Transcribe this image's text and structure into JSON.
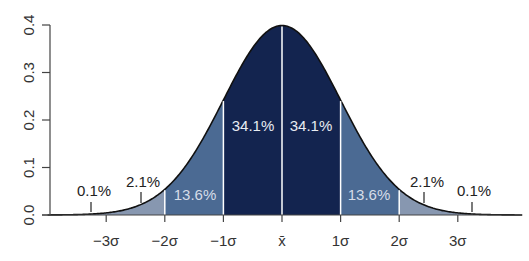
{
  "chart_data": {
    "type": "area",
    "title": "",
    "xlabel": "",
    "ylabel": "",
    "ylim": [
      0,
      0.4
    ],
    "xlim": [
      -4,
      4
    ],
    "grid": false,
    "yticks": [
      "0.0",
      "0.1",
      "0.2",
      "0.3",
      "0.4"
    ],
    "ytick_values": [
      0,
      0.1,
      0.2,
      0.3,
      0.4
    ],
    "xticks": [
      "−3σ",
      "−2σ",
      "−1σ",
      "x̄",
      "1σ",
      "2σ",
      "3σ"
    ],
    "xtick_values": [
      -3,
      -2,
      -1,
      0,
      1,
      2,
      3
    ],
    "distribution": "standard normal density",
    "regions": [
      {
        "from": -4,
        "to": -3,
        "label": "0.1%",
        "value": 0.1,
        "color": "#8797b0"
      },
      {
        "from": -3,
        "to": -2,
        "label": "2.1%",
        "value": 2.1,
        "color": "#8797b0"
      },
      {
        "from": -2,
        "to": -1,
        "label": "13.6%",
        "value": 13.6,
        "color": "#4b6a93"
      },
      {
        "from": -1,
        "to": 0,
        "label": "34.1%",
        "value": 34.1,
        "color": "#13244f"
      },
      {
        "from": 0,
        "to": 1,
        "label": "34.1%",
        "value": 34.1,
        "color": "#13244f"
      },
      {
        "from": 1,
        "to": 2,
        "label": "13.6%",
        "value": 13.6,
        "color": "#4b6a93"
      },
      {
        "from": 2,
        "to": 3,
        "label": "2.1%",
        "value": 2.1,
        "color": "#8797b0"
      },
      {
        "from": 3,
        "to": 4,
        "label": "0.1%",
        "value": 0.1,
        "color": "#8797b0"
      }
    ]
  },
  "labels": {
    "outer_left": "0.1%",
    "tail_left": "2.1%",
    "mid_left": "13.6%",
    "center_left": "34.1%",
    "center_right": "34.1%",
    "mid_right": "13.6%",
    "tail_right": "2.1%",
    "outer_right": "0.1%"
  },
  "colors": {
    "center": "#13244f",
    "mid": "#4b6a93",
    "tail": "#8797b0",
    "axis": "#444444",
    "divider": "#ffffff"
  }
}
